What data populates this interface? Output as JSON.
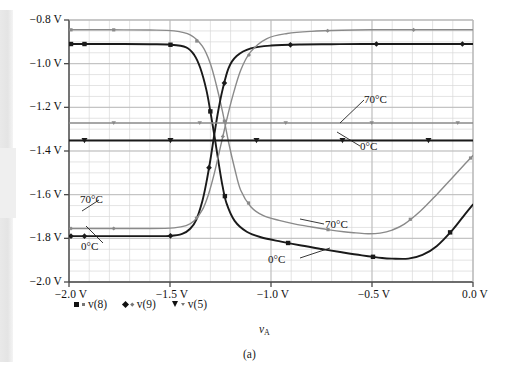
{
  "figure": {
    "caption": "(a)",
    "xaxis_title": "v",
    "xaxis_title_sub": "A"
  },
  "legend": {
    "items": [
      {
        "label": "v(8)",
        "marker": "square-icon"
      },
      {
        "label": "v(9)",
        "marker": "diamond-icon"
      },
      {
        "label": "v(5)",
        "marker": "triangle-icon"
      }
    ]
  },
  "annotations": [
    {
      "id": "ann-70c-mid",
      "text": "70°C"
    },
    {
      "id": "ann-0c-mid",
      "text": "0°C"
    },
    {
      "id": "ann-70c-left",
      "text": "70°C"
    },
    {
      "id": "ann-0c-left",
      "text": "0°C"
    },
    {
      "id": "ann-70c-right",
      "text": "70°C"
    },
    {
      "id": "ann-0c-right",
      "text": "0°C"
    }
  ],
  "colors": {
    "cold_0c": "#1a1a1a",
    "hot_70c": "#8a8a8a",
    "grid_minor": "#d9d9d9",
    "grid_major": "#b8b8b8",
    "axis": "#4a4a4a",
    "background": "#ffffff"
  },
  "chart_data": {
    "type": "line",
    "title": "",
    "xlabel": "vA",
    "ylabel": "",
    "xlim": [
      -2.0,
      0.0
    ],
    "ylim": [
      -2.0,
      -0.8
    ],
    "grid": true,
    "legend_position": "below-axes",
    "xticks": [
      -2.0,
      -1.5,
      -1.0,
      -0.5,
      0.0
    ],
    "xtick_labels": [
      "-2.0 V",
      "-1.5 V",
      "-1.0 V",
      "-0.5 V",
      "0.0 V"
    ],
    "yticks": [
      -0.8,
      -1.0,
      -1.2,
      -1.4,
      -1.6,
      -1.8,
      -2.0
    ],
    "ytick_labels": [
      "-0.8 V",
      "-1.0 V",
      "-1.2 V",
      "-1.4 V",
      "-1.6 V",
      "-1.8 V",
      "-2.0 V"
    ],
    "x_minor_step": 0.1,
    "y_minor_step": 0.05,
    "series": [
      {
        "name": "v(8) 0°C",
        "node": "v(8)",
        "temperature": "0°C",
        "color": "#1a1a1a",
        "marker": "square",
        "x": [
          -2.0,
          -1.8,
          -1.6,
          -1.5,
          -1.42,
          -1.38,
          -1.35,
          -1.32,
          -1.3,
          -1.28,
          -1.26,
          -1.24,
          -1.22,
          -1.18,
          -1.12,
          -1.05,
          -0.95,
          -0.85,
          -0.75,
          -0.65,
          -0.55,
          -0.45,
          -0.4,
          -0.32,
          -0.25,
          -0.18,
          -0.1,
          -0.04,
          0.0
        ],
        "y": [
          -0.91,
          -0.91,
          -0.911,
          -0.913,
          -0.925,
          -0.96,
          -1.02,
          -1.12,
          -1.22,
          -1.33,
          -1.45,
          -1.56,
          -1.64,
          -1.72,
          -1.77,
          -1.795,
          -1.815,
          -1.833,
          -1.849,
          -1.864,
          -1.878,
          -1.89,
          -1.893,
          -1.893,
          -1.876,
          -1.836,
          -1.76,
          -1.69,
          -1.645
        ]
      },
      {
        "name": "v(8) 70°C",
        "node": "v(8)",
        "temperature": "70°C",
        "color": "#8a8a8a",
        "marker": "square",
        "x": [
          -2.0,
          -1.8,
          -1.6,
          -1.48,
          -1.4,
          -1.34,
          -1.3,
          -1.27,
          -1.24,
          -1.21,
          -1.18,
          -1.15,
          -1.1,
          -1.04,
          -0.96,
          -0.88,
          -0.8,
          -0.72,
          -0.64,
          -0.58,
          -0.52,
          -0.46,
          -0.4,
          -0.34,
          -0.26,
          -0.18,
          -0.1,
          -0.04,
          0.0
        ],
        "y": [
          -0.845,
          -0.845,
          -0.846,
          -0.85,
          -0.868,
          -0.92,
          -1.0,
          -1.1,
          -1.22,
          -1.36,
          -1.48,
          -1.58,
          -1.655,
          -1.695,
          -1.718,
          -1.735,
          -1.748,
          -1.76,
          -1.77,
          -1.775,
          -1.779,
          -1.776,
          -1.762,
          -1.735,
          -1.675,
          -1.6,
          -1.52,
          -1.46,
          -1.42
        ]
      },
      {
        "name": "v(9) 0°C",
        "node": "v(9)",
        "temperature": "0°C",
        "color": "#1a1a1a",
        "marker": "diamond",
        "x": [
          -2.0,
          -1.8,
          -1.6,
          -1.5,
          -1.44,
          -1.4,
          -1.37,
          -1.34,
          -1.32,
          -1.3,
          -1.28,
          -1.26,
          -1.24,
          -1.21,
          -1.17,
          -1.1,
          -1.0,
          -0.85,
          -0.7,
          -0.55,
          -0.4,
          -0.25,
          -0.1,
          0.0
        ],
        "y": [
          -1.79,
          -1.79,
          -1.79,
          -1.789,
          -1.78,
          -1.756,
          -1.715,
          -1.63,
          -1.545,
          -1.44,
          -1.32,
          -1.21,
          -1.12,
          -1.02,
          -0.965,
          -0.93,
          -0.917,
          -0.912,
          -0.911,
          -0.91,
          -0.91,
          -0.91,
          -0.91,
          -0.91
        ]
      },
      {
        "name": "v(9) 70°C",
        "node": "v(9)",
        "temperature": "70°C",
        "color": "#8a8a8a",
        "marker": "diamond",
        "x": [
          -2.0,
          -1.8,
          -1.6,
          -1.48,
          -1.42,
          -1.38,
          -1.34,
          -1.31,
          -1.28,
          -1.25,
          -1.22,
          -1.19,
          -1.15,
          -1.1,
          -1.02,
          -0.92,
          -0.8,
          -0.65,
          -0.5,
          -0.35,
          -0.2,
          -0.1,
          0.0
        ],
        "y": [
          -1.755,
          -1.755,
          -1.755,
          -1.752,
          -1.742,
          -1.72,
          -1.67,
          -1.6,
          -1.5,
          -1.38,
          -1.26,
          -1.15,
          -1.03,
          -0.945,
          -0.885,
          -0.862,
          -0.852,
          -0.847,
          -0.845,
          -0.845,
          -0.845,
          -0.845,
          -0.845
        ]
      },
      {
        "name": "v(5) 0°C",
        "node": "v(5)",
        "temperature": "0°C",
        "color": "#1a1a1a",
        "marker": "triangle",
        "x": [
          -2.0,
          0.0
        ],
        "y": [
          -1.352,
          -1.352
        ]
      },
      {
        "name": "v(5) 70°C",
        "node": "v(5)",
        "temperature": "70°C",
        "color": "#8a8a8a",
        "marker": "triangle",
        "x": [
          -2.0,
          0.0
        ],
        "y": [
          -1.272,
          -1.272
        ]
      }
    ]
  }
}
